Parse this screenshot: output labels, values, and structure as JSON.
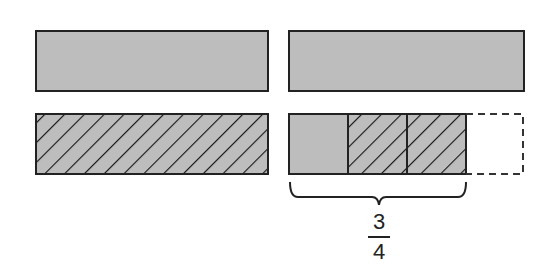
{
  "diagram": {
    "type": "fraction-bar-model",
    "colors": {
      "fill": "#bdbdbd",
      "stroke": "#222222",
      "hatch": "#111111",
      "background": "#ffffff"
    },
    "left_column": {
      "top_bar": {
        "style": "solid-gray"
      },
      "bottom_bar": {
        "style": "hatched"
      }
    },
    "right_column": {
      "top_bar": {
        "style": "solid-gray"
      },
      "bottom_bar": {
        "segments": [
          {
            "style": "solid-gray"
          },
          {
            "style": "hatched"
          },
          {
            "style": "hatched"
          },
          {
            "style": "dashed-empty"
          }
        ]
      },
      "brace": {
        "spans_segments": 3
      },
      "label": {
        "numerator": "3",
        "denominator": "4"
      }
    }
  }
}
